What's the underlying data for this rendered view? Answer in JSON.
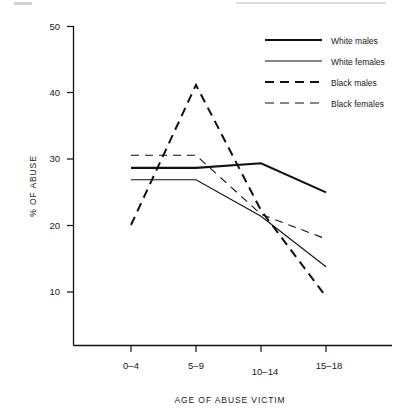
{
  "chart_data": {
    "type": "line",
    "title": "",
    "xlabel": "AGE OF ABUSE VICTIM",
    "ylabel": "% OF ABUSE",
    "categories": [
      "0–4",
      "5–9",
      "10–14",
      "15–18"
    ],
    "ylim": [
      0,
      50
    ],
    "yticks": [
      10,
      20,
      30,
      40,
      50
    ],
    "ytick_labels": [
      "10",
      "20",
      "30",
      "40",
      "50"
    ],
    "grid": false,
    "legend_position": "top-right",
    "series": [
      {
        "name": "White males",
        "style": "solid",
        "width": 2.1,
        "values": [
          28.7,
          28.7,
          29.4,
          25.0
        ]
      },
      {
        "name": "White females",
        "style": "solid",
        "width": 1.1,
        "values": [
          26.9,
          26.9,
          21.4,
          13.8
        ]
      },
      {
        "name": "Black males",
        "style": "dashed",
        "width": 2.0,
        "values": [
          20.1,
          41.2,
          22.3,
          9.3
        ]
      },
      {
        "name": "Black females",
        "style": "dashed",
        "width": 1.1,
        "values": [
          30.6,
          30.6,
          21.7,
          18.0
        ]
      }
    ]
  },
  "legend": {
    "entries": [
      {
        "label": "White males"
      },
      {
        "label": "White females"
      },
      {
        "label": "Black males"
      },
      {
        "label": "Black females"
      }
    ]
  },
  "axes": {
    "y_title": "% OF ABUSE",
    "x_title": "AGE OF ABUSE VICTIM"
  }
}
